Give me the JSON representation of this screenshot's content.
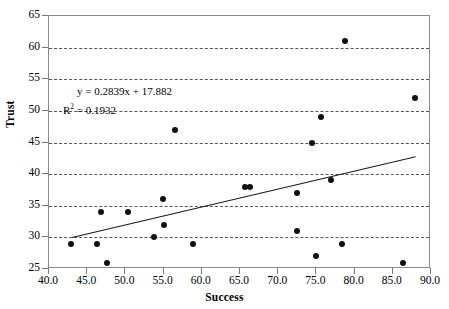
{
  "chart_data": {
    "type": "scatter",
    "title": "",
    "xlabel": "Success",
    "ylabel": "Trust",
    "xlim": [
      40.0,
      90.0
    ],
    "ylim": [
      25,
      65
    ],
    "xticks": [
      "40.0",
      "45.0",
      "50.0",
      "55.0",
      "60.0",
      "65.0",
      "70.0",
      "75.0",
      "80.0",
      "85.0",
      "90.0"
    ],
    "yticks": [
      "25",
      "30",
      "35",
      "40",
      "45",
      "50",
      "55",
      "60",
      "65"
    ],
    "grid": "horizontal-dashed",
    "legend": "none",
    "points": [
      {
        "x": 42.9,
        "y": 29
      },
      {
        "x": 46.3,
        "y": 29
      },
      {
        "x": 46.8,
        "y": 34
      },
      {
        "x": 47.6,
        "y": 26
      },
      {
        "x": 50.4,
        "y": 34
      },
      {
        "x": 53.8,
        "y": 30
      },
      {
        "x": 54.9,
        "y": 36
      },
      {
        "x": 55.1,
        "y": 32
      },
      {
        "x": 56.5,
        "y": 47
      },
      {
        "x": 58.9,
        "y": 29
      },
      {
        "x": 65.6,
        "y": 38
      },
      {
        "x": 66.3,
        "y": 38
      },
      {
        "x": 72.4,
        "y": 31
      },
      {
        "x": 72.5,
        "y": 37
      },
      {
        "x": 74.4,
        "y": 45
      },
      {
        "x": 75.0,
        "y": 27
      },
      {
        "x": 75.6,
        "y": 49
      },
      {
        "x": 76.9,
        "y": 39
      },
      {
        "x": 78.4,
        "y": 29
      },
      {
        "x": 78.8,
        "y": 61
      },
      {
        "x": 86.4,
        "y": 26
      },
      {
        "x": 87.9,
        "y": 52
      }
    ],
    "trendline": {
      "slope": 0.2839,
      "intercept": 17.882,
      "x_start": 43.0,
      "x_end": 88.0,
      "equation_label": "y = 0.2839x + 17.882",
      "r_squared_label_prefix": "R",
      "r_squared_label_sup": "2",
      "r_squared_label_value": " = 0.1932"
    },
    "colors": {
      "point": "#111111",
      "line": "#1a1a1a",
      "grid": "#555555",
      "frame": "#8a8a8a",
      "background": "#ffffff"
    }
  }
}
